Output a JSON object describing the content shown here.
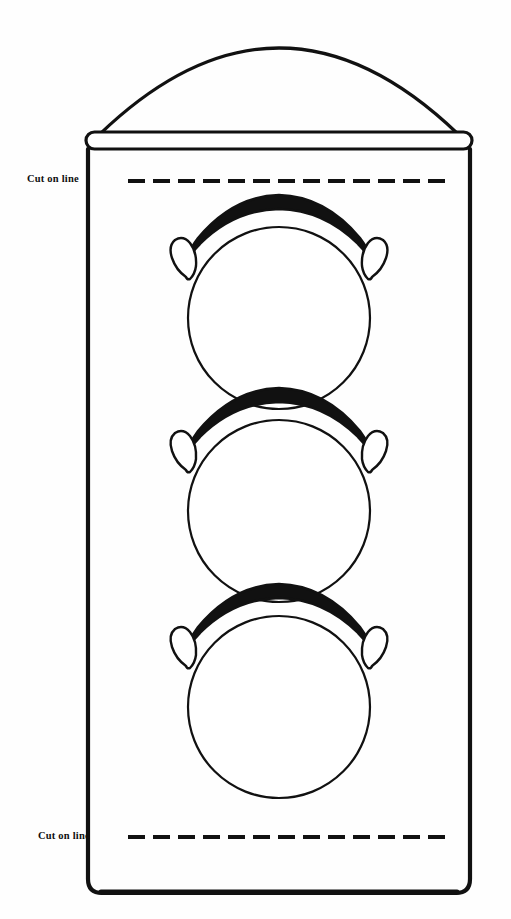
{
  "page": {
    "background_color": "#fefefe",
    "ink_color": "#111111",
    "width": 511,
    "height": 919
  },
  "figure": {
    "name": "traffic-light-cutout-template"
  },
  "labels": {
    "top_cut": "Cut on line",
    "bottom_cut": "Cut on line"
  },
  "cut_lines": {
    "top": {
      "y": 181,
      "x_start": 128,
      "x_end": 448,
      "dash_count": 13
    },
    "bottom": {
      "y": 837,
      "x_start": 128,
      "x_end": 448,
      "dash_count": 13
    }
  },
  "housing": {
    "left": 88,
    "right": 470,
    "top": 150,
    "bottom": 893,
    "corner_radius": 14,
    "stroke_width": 4
  },
  "cap_bar": {
    "left": 86,
    "right": 472,
    "top": 132,
    "height": 17,
    "corner_radius": 8,
    "stroke_width": 3
  },
  "dome": {
    "apex_x": 279,
    "apex_y": 42,
    "left_x": 100,
    "right_x": 458,
    "base_y": 134,
    "stroke_width": 3
  },
  "lamps": [
    {
      "name": "lamp-top",
      "cx": 279,
      "cy": 318,
      "r": 91
    },
    {
      "name": "lamp-middle",
      "cx": 279,
      "cy": 511,
      "r": 91
    },
    {
      "name": "lamp-bottom",
      "cx": 279,
      "cy": 707,
      "r": 91
    }
  ],
  "visors": [
    {
      "name": "visor-top",
      "cx": 279,
      "cy": 318
    },
    {
      "name": "visor-middle",
      "cx": 279,
      "cy": 511
    },
    {
      "name": "visor-bottom",
      "cx": 279,
      "cy": 707
    }
  ]
}
